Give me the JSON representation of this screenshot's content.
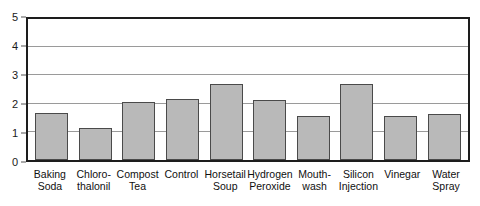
{
  "chart_data": {
    "type": "bar",
    "title": "",
    "subtitle": "",
    "xlabel": "",
    "ylabel": "",
    "ylim": [
      0,
      5
    ],
    "yticks": [
      0,
      1,
      2,
      3,
      4,
      5
    ],
    "ytick_labels": [
      "0",
      "1",
      "2",
      "3",
      "4",
      "5"
    ],
    "grid": true,
    "grid_axis": "y",
    "legend": false,
    "legend_position": "none",
    "categories": [
      "Baking Soda",
      "Chloro-thalonil",
      "Compost Tea",
      "Control",
      "Horsetail Soup",
      "Hydrogen Peroxide",
      "Mouth-wash",
      "Silicon Injection",
      "Vinegar",
      "Water Spray"
    ],
    "category_lines": [
      [
        "Baking",
        "Soda"
      ],
      [
        "Chloro-",
        "thalonil"
      ],
      [
        "Compost",
        "Tea"
      ],
      [
        "Control",
        ""
      ],
      [
        "Horsetail",
        "Soup"
      ],
      [
        "Hydrogen",
        "Peroxide"
      ],
      [
        "Mouth-",
        "wash"
      ],
      [
        "Silicon",
        "Injection"
      ],
      [
        "Vinegar",
        ""
      ],
      [
        "Water",
        "Spray"
      ]
    ],
    "values": [
      1.65,
      1.12,
      2.07,
      2.18,
      2.7,
      2.12,
      1.56,
      2.68,
      1.56,
      1.64
    ],
    "bar_color": "#b9b9b9",
    "bar_border_color": "#4a4a4a",
    "axis_color": "#1d1d1d",
    "gridline_color": "#9a9a9a",
    "text_color": "#101010",
    "background": "#ffffff"
  }
}
